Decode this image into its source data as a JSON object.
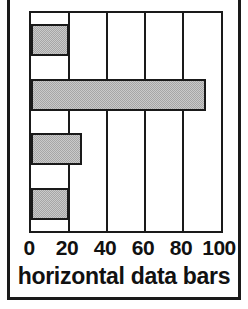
{
  "chart_data": {
    "type": "bar",
    "orientation": "horizontal",
    "title": "horizontal data bars",
    "xlabel": "",
    "ylabel": "",
    "categories": [
      "bar-1",
      "bar-2",
      "bar-3",
      "bar-4"
    ],
    "values": [
      20,
      92,
      27,
      20
    ],
    "xlim": [
      0,
      100
    ],
    "xticks": [
      0,
      20,
      40,
      60,
      80,
      100
    ],
    "xtick_labels": [
      "0",
      "20",
      "40",
      "60",
      "80",
      "100"
    ],
    "grid": "vertical gridlines at each x tick",
    "legend": "none",
    "bar_fill_color": "#a6a6a6",
    "bar_edge_color": "#1a1a1a",
    "axis_color": "#1a1a1a",
    "background_color": "#ffffff",
    "series": [
      {
        "name": "values",
        "values": [
          20,
          92,
          27,
          20
        ]
      }
    ]
  },
  "figure": {
    "frame_color": "#1a1a1a"
  }
}
